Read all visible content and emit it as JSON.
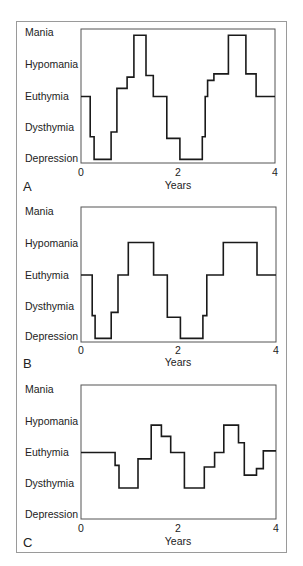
{
  "chart_data": [
    {
      "type": "line",
      "style": "step",
      "panel": "A",
      "title": "",
      "xlabel": "Years",
      "ylabel": "",
      "xlim": [
        0,
        4
      ],
      "xticks": [
        "0",
        "2",
        "4"
      ],
      "y_categories": [
        "Depression",
        "Dysthymia",
        "Euthymia",
        "Hypomania",
        "Mania"
      ],
      "ylim": [
        0,
        4
      ],
      "grid": false,
      "legend": null,
      "x": [
        0,
        0.19,
        0.27,
        0.62,
        0.74,
        0.95,
        1.09,
        1.34,
        1.49,
        1.77,
        2.04,
        2.5,
        2.56,
        2.61,
        2.74,
        3.04,
        3.4,
        3.61,
        4.0
      ],
      "values": [
        2.0,
        0.75,
        0.05,
        0.9,
        2.25,
        2.6,
        3.9,
        2.65,
        2.0,
        0.7,
        0.05,
        0.75,
        2.0,
        2.5,
        2.7,
        3.9,
        2.7,
        2.0,
        2.0
      ]
    },
    {
      "type": "line",
      "style": "step",
      "panel": "B",
      "title": "",
      "xlabel": "Years",
      "ylabel": "",
      "xlim": [
        0,
        4
      ],
      "xticks": [
        "0",
        "2",
        "4"
      ],
      "y_categories": [
        "Depression",
        "Dysthymia",
        "Euthymia",
        "Hypomania",
        "Mania"
      ],
      "ylim": [
        0,
        4
      ],
      "grid": false,
      "legend": null,
      "x": [
        0,
        0.23,
        0.29,
        0.62,
        0.76,
        0.97,
        1.49,
        1.77,
        2.04,
        2.5,
        2.58,
        2.92,
        3.61,
        4.0
      ],
      "values": [
        2.0,
        0.75,
        0.05,
        0.85,
        2.0,
        3.0,
        2.0,
        0.7,
        0.05,
        0.75,
        2.0,
        3.0,
        2.0,
        2.0
      ]
    },
    {
      "type": "line",
      "style": "step",
      "panel": "C",
      "title": "",
      "xlabel": "Years",
      "ylabel": "",
      "xlim": [
        0,
        4
      ],
      "xticks": [
        "0",
        "2",
        "4"
      ],
      "y_categories": [
        "Depression",
        "Dysthymia",
        "Euthymia",
        "Hypomania",
        "Mania"
      ],
      "ylim": [
        0,
        4
      ],
      "grid": false,
      "legend": null,
      "x": [
        0,
        0.7,
        0.78,
        1.17,
        1.44,
        1.65,
        1.84,
        2.12,
        2.53,
        2.74,
        2.93,
        3.23,
        3.35,
        3.6,
        3.74,
        4.0
      ],
      "values": [
        2.0,
        1.6,
        0.9,
        1.8,
        2.85,
        2.5,
        2.0,
        0.9,
        1.55,
        2.0,
        2.85,
        2.3,
        1.3,
        1.5,
        2.05,
        2.05
      ]
    }
  ],
  "figure": {
    "panels": [
      {
        "label": "A",
        "xlabel": "Years",
        "xticks": [
          "0",
          "2",
          "4"
        ],
        "ylabels": [
          "Mania",
          "Hypomania",
          "Euthymia",
          "Dysthymia",
          "Depression"
        ]
      },
      {
        "label": "B",
        "xlabel": "Years",
        "xticks": [
          "0",
          "2",
          "4"
        ],
        "ylabels": [
          "Mania",
          "Hypomania",
          "Euthymia",
          "Dysthymia",
          "Depression"
        ]
      },
      {
        "label": "C",
        "xlabel": "Years",
        "xticks": [
          "0",
          "2",
          "4"
        ],
        "ylabels": [
          "Mania",
          "Hypomania",
          "Euthymia",
          "Dysthymia",
          "Depression"
        ]
      }
    ]
  }
}
